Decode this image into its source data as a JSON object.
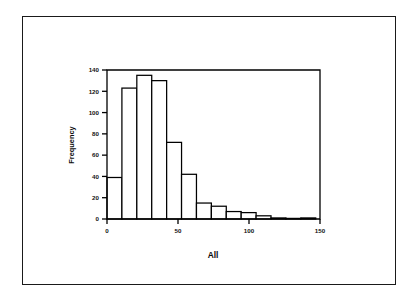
{
  "figure": {
    "background_color": "#ffffff",
    "border_color": "#1a1a1a",
    "line_color": "#000000"
  },
  "chart_data": {
    "type": "bar",
    "title": "",
    "subtitle": "",
    "xlabel": "All",
    "ylabel": "Frequency",
    "xlim": [
      0,
      150
    ],
    "ylim": [
      0,
      140
    ],
    "grid": false,
    "legend": false,
    "legend_position": "none",
    "bar_style": "histogram-unfilled",
    "bar_fill": "#ffffff",
    "bar_edge": "#000000",
    "bin_width": 10.5,
    "bin_start": 0,
    "xticks": [
      0,
      50,
      100,
      150
    ],
    "xtick_labels": [
      "0",
      "50",
      "100",
      "150"
    ],
    "yticks": [
      0,
      20,
      40,
      60,
      80,
      100,
      120,
      140
    ],
    "ytick_labels": [
      "0",
      "20",
      "40",
      "60",
      "80",
      "100",
      "120",
      "140"
    ],
    "bin_edges": [
      0,
      10.5,
      21,
      31.5,
      42,
      52.5,
      63,
      73.5,
      84,
      94.5,
      105,
      115.5,
      126,
      136.5,
      147
    ],
    "categories": [
      "0-10.5",
      "10.5-21",
      "21-31.5",
      "31.5-42",
      "42-52.5",
      "52.5-63",
      "63-73.5",
      "73.5-84",
      "84-94.5",
      "94.5-105",
      "105-115.5",
      "115.5-126",
      "126-136.5",
      "136.5-147"
    ],
    "values": [
      39,
      123,
      135,
      130,
      72,
      42,
      15,
      12,
      7,
      6,
      3,
      1,
      0,
      1
    ],
    "annotations": []
  }
}
